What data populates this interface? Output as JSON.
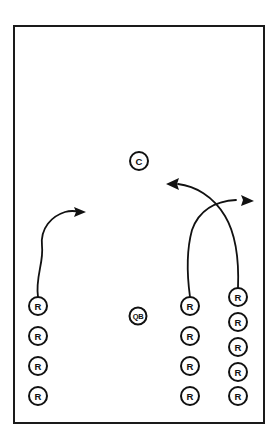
{
  "diagram": {
    "type": "play-diagram",
    "background_color": "#ffffff",
    "line_color": "#111111",
    "field": {
      "x": 13,
      "y": 25,
      "width": 252,
      "height": 399,
      "border_color": "#1a1a1a",
      "border_width": 2
    },
    "players": [
      {
        "id": "left-r-1",
        "label": "R",
        "cx": 38,
        "cy": 306,
        "r": 9,
        "group": "left-column"
      },
      {
        "id": "left-r-2",
        "label": "R",
        "cx": 38,
        "cy": 336,
        "r": 9,
        "group": "left-column"
      },
      {
        "id": "left-r-3",
        "label": "R",
        "cx": 38,
        "cy": 366,
        "r": 9,
        "group": "left-column"
      },
      {
        "id": "left-r-4",
        "label": "R",
        "cx": 38,
        "cy": 396,
        "r": 9,
        "group": "left-column"
      },
      {
        "id": "quarterback",
        "label": "QB",
        "cx": 138,
        "cy": 316,
        "r": 8.5,
        "group": "backfield"
      },
      {
        "id": "center",
        "label": "C",
        "cx": 139,
        "cy": 161,
        "r": 9,
        "group": "downfield"
      },
      {
        "id": "mid-r-1",
        "label": "R",
        "cx": 190,
        "cy": 306,
        "r": 9,
        "group": "middle-column"
      },
      {
        "id": "mid-r-2",
        "label": "R",
        "cx": 190,
        "cy": 336,
        "r": 9,
        "group": "middle-column"
      },
      {
        "id": "mid-r-3",
        "label": "R",
        "cx": 190,
        "cy": 366,
        "r": 9,
        "group": "middle-column"
      },
      {
        "id": "mid-r-4",
        "label": "R",
        "cx": 190,
        "cy": 396,
        "r": 9,
        "group": "middle-column"
      },
      {
        "id": "right-r-1",
        "label": "R",
        "cx": 238,
        "cy": 297,
        "r": 9,
        "group": "right-column"
      },
      {
        "id": "right-r-2",
        "label": "R",
        "cx": 238,
        "cy": 322,
        "r": 9,
        "group": "right-column"
      },
      {
        "id": "right-r-3",
        "label": "R",
        "cx": 238,
        "cy": 347,
        "r": 9,
        "group": "right-column"
      },
      {
        "id": "right-r-4",
        "label": "R",
        "cx": 238,
        "cy": 372,
        "r": 9,
        "group": "right-column"
      },
      {
        "id": "right-r-5",
        "label": "R",
        "cx": 238,
        "cy": 396,
        "r": 9,
        "group": "right-column"
      }
    ],
    "routes": [
      {
        "id": "route-left",
        "from": "left-r-1",
        "direction": "up-and-right",
        "path": "M 38 297 C 35 278 44 262 42 246 C 40 228 52 216 65 212 C 72 210 76 211 80 212",
        "arrow": {
          "tip_x": 85,
          "tip_y": 212,
          "angle_deg": 9
        }
      },
      {
        "id": "route-middle",
        "from": "mid-r-1",
        "direction": "up-and-right",
        "path": "M 190 297 C 187 275 186 252 192 230 C 199 210 216 201 236 200",
        "arrow": {
          "tip_x": 253,
          "tip_y": 201,
          "angle_deg": 2
        }
      },
      {
        "id": "route-right",
        "from": "right-r-1",
        "direction": "up-and-left",
        "path": "M 238 288 C 239 262 237 236 225 216 C 213 196 195 186 178 184",
        "arrow": {
          "tip_x": 167,
          "tip_y": 184,
          "angle_deg": 184
        }
      }
    ]
  }
}
